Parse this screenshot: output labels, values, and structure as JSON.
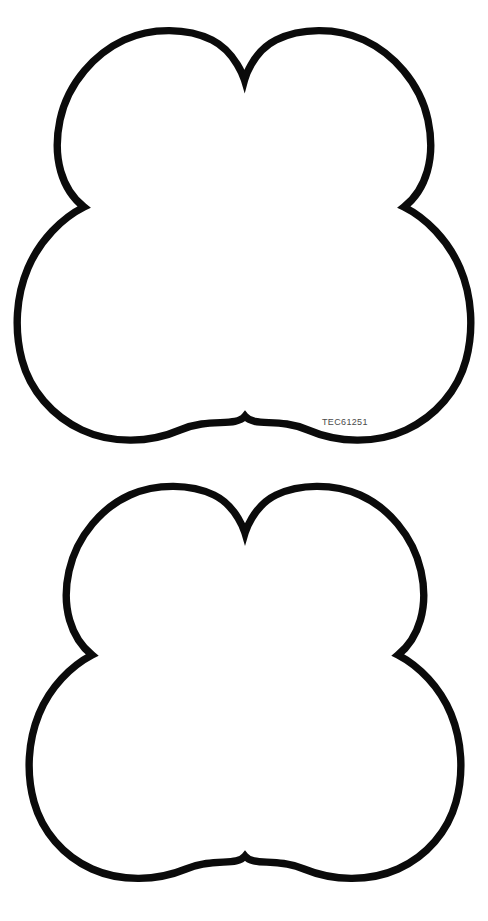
{
  "page": {
    "background_color": "#ffffff",
    "width": 488,
    "height": 921,
    "document_type": "technical-line-drawing"
  },
  "drawing": {
    "stroke_color": "#0b0b0b",
    "fill_color": "#ffffff",
    "stroke_width_px": 7.4,
    "shape_name": "quatrefoil-outline",
    "lobe_count": 4,
    "description": "Four-lobed quatrefoil outline with two smaller upper lobes and two larger lower lobes"
  },
  "figures": [
    {
      "id": "figure-top",
      "part_number": "TEC61251",
      "label_color": "#4a4a4a",
      "outline_path": "M 244.5 80 C 244.5 80 236 52 212 40 C 188 28 152 27 124 40 C 96 53 68 82 60 120 C 52 158 62 190 84 207 C 62 218 40 240 28 268 C 16 296 14 330 22 360 C 30 390 52 416 82 430 C 112 444 150 443 180 430 C 210 417 235 428 245 416 C 255 428 278 417 308 430 C 338 443 376 444 406 430 C 436 416 458 390 466 360 C 474 330 472 296 460 268 C 448 240 426 218 404 207 C 426 190 436 158 428 120 C 420 82 392 53 364 40 C 336 27 300 28 276 40 C 252 52 244.5 80 244.5 80 Z"
    },
    {
      "id": "figure-bottom",
      "part_number": "TEC61251",
      "label_color": "#4a4a4a",
      "outline_path": "M 245 73 C 245 73 237 46 214 35 C 191 24 157 23 130 35 C 103 47 77 75 69 111 C 61 147 71 178 92 195 C 71 206 50 227 39 254 C 28 281 26 313 34 342 C 42 371 63 396 92 409 C 121 422 157 421 186 409 C 215 397 236 407 245 396 C 254 407 275 397 304 409 C 333 421 369 422 398 409 C 427 396 448 371 456 342 C 464 313 462 281 451 254 C 440 227 419 206 398 195 C 419 178 429 147 421 111 C 413 75 387 47 360 35 C 333 23 299 24 276 35 C 253 46 245 73 245 73 Z"
    }
  ]
}
